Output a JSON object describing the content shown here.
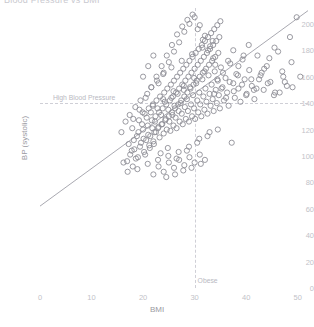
{
  "title": "Blood Pressure vs BMI",
  "axes": {
    "xlabel": "BMI",
    "ylabel": "BP (systolic)",
    "xticks": [
      "0",
      "10",
      "20",
      "30",
      "40",
      "50"
    ],
    "yticks": [
      "0",
      "20",
      "40",
      "60",
      "80",
      "100",
      "120",
      "140",
      "160",
      "180",
      "200"
    ]
  },
  "annotations": {
    "high_bp": "High Blood Pressure",
    "obese": "Obese"
  },
  "colors": {
    "marker": "#8e8e96",
    "trend": "#a9a9b1",
    "refline": "#cfcfd6",
    "tick": "#c2c2c8"
  },
  "chart_data": {
    "type": "scatter",
    "title": "Blood Pressure vs BMI",
    "xlabel": "BMI",
    "ylabel": "BP (systolic)",
    "xlim": [
      0,
      52
    ],
    "ylim": [
      0,
      212
    ],
    "xticks": [
      0,
      10,
      20,
      30,
      40,
      50
    ],
    "yticks": [
      0,
      20,
      40,
      60,
      80,
      100,
      120,
      140,
      160,
      180,
      200
    ],
    "grid": false,
    "legend": "none",
    "marker_style": "open-circle",
    "reference_lines": [
      {
        "orientation": "horizontal",
        "value": 140,
        "label": "High Blood Pressure",
        "style": "dashed"
      },
      {
        "orientation": "vertical",
        "value": 30,
        "label": "Obese",
        "style": "dashed"
      }
    ],
    "trend_line": {
      "x": [
        0,
        52
      ],
      "y": [
        62,
        210
      ],
      "style": "solid"
    },
    "points": [
      [
        17.8,
        104
      ],
      [
        18.2,
        112
      ],
      [
        18.6,
        98
      ],
      [
        19.1,
        118
      ],
      [
        19.4,
        107
      ],
      [
        19.8,
        124
      ],
      [
        20.1,
        113
      ],
      [
        20.4,
        101
      ],
      [
        20.7,
        129
      ],
      [
        21.0,
        116
      ],
      [
        21.2,
        108
      ],
      [
        21.5,
        133
      ],
      [
        21.8,
        121
      ],
      [
        22.0,
        111
      ],
      [
        22.3,
        126
      ],
      [
        22.5,
        118
      ],
      [
        22.8,
        136
      ],
      [
        23.0,
        122
      ],
      [
        23.2,
        114
      ],
      [
        23.5,
        131
      ],
      [
        23.7,
        124
      ],
      [
        24.0,
        117
      ],
      [
        24.2,
        141
      ],
      [
        24.4,
        128
      ],
      [
        24.6,
        120
      ],
      [
        24.9,
        135
      ],
      [
        25.1,
        126
      ],
      [
        25.3,
        119
      ],
      [
        25.5,
        144
      ],
      [
        25.7,
        131
      ],
      [
        25.9,
        123
      ],
      [
        26.1,
        138
      ],
      [
        26.3,
        129
      ],
      [
        26.5,
        121
      ],
      [
        26.7,
        147
      ],
      [
        26.9,
        134
      ],
      [
        27.1,
        126
      ],
      [
        27.3,
        140
      ],
      [
        27.5,
        132
      ],
      [
        27.7,
        124
      ],
      [
        27.9,
        150
      ],
      [
        28.1,
        137
      ],
      [
        28.3,
        128
      ],
      [
        28.5,
        143
      ],
      [
        28.7,
        134
      ],
      [
        28.9,
        126
      ],
      [
        29.1,
        152
      ],
      [
        29.3,
        139
      ],
      [
        29.5,
        130
      ],
      [
        29.7,
        146
      ],
      [
        29.9,
        136
      ],
      [
        30.1,
        128
      ],
      [
        30.3,
        155
      ],
      [
        30.5,
        142
      ],
      [
        30.7,
        133
      ],
      [
        30.9,
        148
      ],
      [
        31.1,
        139
      ],
      [
        31.3,
        130
      ],
      [
        31.5,
        158
      ],
      [
        31.7,
        145
      ],
      [
        31.9,
        135
      ],
      [
        32.1,
        151
      ],
      [
        32.3,
        141
      ],
      [
        32.5,
        132
      ],
      [
        32.7,
        161
      ],
      [
        32.9,
        147
      ],
      [
        33.1,
        138
      ],
      [
        33.3,
        154
      ],
      [
        33.5,
        143
      ],
      [
        33.7,
        134
      ],
      [
        33.9,
        164
      ],
      [
        34.1,
        150
      ],
      [
        34.3,
        140
      ],
      [
        34.5,
        157
      ],
      [
        34.7,
        146
      ],
      [
        34.9,
        136
      ],
      [
        35.1,
        167
      ],
      [
        35.4,
        152
      ],
      [
        35.7,
        142
      ],
      [
        36.0,
        159
      ],
      [
        36.3,
        148
      ],
      [
        36.6,
        138
      ],
      [
        36.9,
        170
      ],
      [
        37.2,
        110
      ],
      [
        37.5,
        155
      ],
      [
        37.8,
        144
      ],
      [
        38.1,
        162
      ],
      [
        38.5,
        151
      ],
      [
        38.9,
        141
      ],
      [
        39.3,
        173
      ],
      [
        39.7,
        158
      ],
      [
        40.1,
        147
      ],
      [
        40.6,
        165
      ],
      [
        41.1,
        153
      ],
      [
        41.6,
        143
      ],
      [
        42.2,
        176
      ],
      [
        42.8,
        161
      ],
      [
        43.4,
        150
      ],
      [
        44.0,
        168
      ],
      [
        44.7,
        156
      ],
      [
        45.4,
        146
      ],
      [
        46.2,
        179
      ],
      [
        47.0,
        164
      ],
      [
        47.9,
        153
      ],
      [
        48.8,
        171
      ],
      [
        49.8,
        205
      ],
      [
        50.5,
        160
      ],
      [
        16.9,
        96
      ],
      [
        17.2,
        109
      ],
      [
        17.5,
        101
      ],
      [
        17.9,
        121
      ],
      [
        18.3,
        105
      ],
      [
        18.8,
        115
      ],
      [
        19.2,
        127
      ],
      [
        19.6,
        110
      ],
      [
        20.0,
        120
      ],
      [
        20.3,
        132
      ],
      [
        20.6,
        112
      ],
      [
        20.9,
        123
      ],
      [
        21.1,
        136
      ],
      [
        21.4,
        115
      ],
      [
        21.7,
        127
      ],
      [
        21.9,
        139
      ],
      [
        22.2,
        118
      ],
      [
        22.4,
        130
      ],
      [
        22.6,
        142
      ],
      [
        22.9,
        121
      ],
      [
        23.1,
        133
      ],
      [
        23.3,
        145
      ],
      [
        23.6,
        124
      ],
      [
        23.8,
        136
      ],
      [
        24.1,
        148
      ],
      [
        24.3,
        127
      ],
      [
        24.5,
        139
      ],
      [
        24.7,
        151
      ],
      [
        25.0,
        130
      ],
      [
        25.2,
        142
      ],
      [
        25.4,
        154
      ],
      [
        25.6,
        133
      ],
      [
        25.8,
        145
      ],
      [
        26.0,
        157
      ],
      [
        26.2,
        136
      ],
      [
        26.4,
        148
      ],
      [
        26.6,
        160
      ],
      [
        26.8,
        139
      ],
      [
        27.0,
        151
      ],
      [
        27.2,
        163
      ],
      [
        27.4,
        142
      ],
      [
        27.6,
        154
      ],
      [
        27.8,
        166
      ],
      [
        28.0,
        145
      ],
      [
        28.2,
        157
      ],
      [
        28.4,
        169
      ],
      [
        28.6,
        148
      ],
      [
        28.8,
        160
      ],
      [
        29.0,
        172
      ],
      [
        29.2,
        151
      ],
      [
        29.4,
        163
      ],
      [
        29.6,
        175
      ],
      [
        29.8,
        154
      ],
      [
        30.0,
        166
      ],
      [
        30.2,
        178
      ],
      [
        30.4,
        157
      ],
      [
        30.6,
        169
      ],
      [
        30.8,
        181
      ],
      [
        31.0,
        160
      ],
      [
        31.2,
        172
      ],
      [
        31.4,
        184
      ],
      [
        31.6,
        163
      ],
      [
        31.8,
        175
      ],
      [
        32.0,
        187
      ],
      [
        32.2,
        166
      ],
      [
        32.4,
        178
      ],
      [
        32.6,
        190
      ],
      [
        32.8,
        169
      ],
      [
        33.0,
        181
      ],
      [
        33.2,
        193
      ],
      [
        33.4,
        172
      ],
      [
        33.6,
        184
      ],
      [
        33.8,
        196
      ],
      [
        34.0,
        175
      ],
      [
        34.2,
        187
      ],
      [
        34.4,
        199
      ],
      [
        34.6,
        178
      ],
      [
        34.8,
        190
      ],
      [
        35.0,
        202
      ],
      [
        15.8,
        118
      ],
      [
        16.2,
        95
      ],
      [
        16.6,
        126
      ],
      [
        17.0,
        88
      ],
      [
        17.4,
        131
      ],
      [
        18.0,
        92
      ],
      [
        18.5,
        137
      ],
      [
        19.0,
        99
      ],
      [
        19.5,
        142
      ],
      [
        20.2,
        103
      ],
      [
        20.8,
        147
      ],
      [
        21.3,
        106
      ],
      [
        21.6,
        152
      ],
      [
        22.1,
        109
      ],
      [
        22.7,
        157
      ],
      [
        23.4,
        102
      ],
      [
        23.9,
        162
      ],
      [
        24.8,
        106
      ],
      [
        25.5,
        167
      ],
      [
        26.5,
        98
      ],
      [
        27.5,
        172
      ],
      [
        28.5,
        104
      ],
      [
        29.5,
        177
      ],
      [
        30.5,
        110
      ],
      [
        31.5,
        182
      ],
      [
        32.5,
        115
      ],
      [
        33.5,
        187
      ],
      [
        34.5,
        120
      ],
      [
        19.3,
        135
      ],
      [
        20.5,
        144
      ],
      [
        21.6,
        152
      ],
      [
        22.6,
        160
      ],
      [
        23.6,
        168
      ],
      [
        24.6,
        176
      ],
      [
        25.6,
        184
      ],
      [
        26.6,
        192
      ],
      [
        27.6,
        198
      ],
      [
        28.6,
        203
      ],
      [
        29.6,
        207
      ],
      [
        30.6,
        196
      ],
      [
        31.6,
        188
      ],
      [
        32.6,
        180
      ],
      [
        33.6,
        174
      ],
      [
        18.1,
        128
      ],
      [
        18.9,
        90
      ],
      [
        19.9,
        133
      ],
      [
        20.9,
        94
      ],
      [
        21.9,
        138
      ],
      [
        22.9,
        97
      ],
      [
        23.9,
        143
      ],
      [
        24.9,
        100
      ],
      [
        25.9,
        149
      ],
      [
        26.9,
        103
      ],
      [
        27.9,
        153
      ],
      [
        28.9,
        107
      ],
      [
        29.9,
        159
      ],
      [
        30.9,
        113
      ],
      [
        31.9,
        164
      ],
      [
        32.9,
        118
      ],
      [
        35.5,
        163
      ],
      [
        36.5,
        172
      ],
      [
        37.5,
        180
      ],
      [
        38.5,
        168
      ],
      [
        39.5,
        176
      ],
      [
        40.5,
        184
      ],
      [
        41.5,
        150
      ],
      [
        42.5,
        158
      ],
      [
        43.5,
        166
      ],
      [
        44.5,
        174
      ],
      [
        45.5,
        182
      ],
      [
        46.5,
        148
      ],
      [
        47.5,
        156
      ],
      [
        48.5,
        190
      ],
      [
        22.0,
        86
      ],
      [
        23.0,
        92
      ],
      [
        24.0,
        88
      ],
      [
        25.0,
        95
      ],
      [
        26.0,
        91
      ],
      [
        27.0,
        97
      ],
      [
        28.0,
        93
      ],
      [
        29.0,
        99
      ],
      [
        30.0,
        95
      ],
      [
        31.0,
        101
      ],
      [
        32.0,
        97
      ],
      [
        24.5,
        84
      ],
      [
        26.2,
        86
      ],
      [
        27.8,
        89
      ],
      [
        29.4,
        91
      ],
      [
        31.2,
        94
      ],
      [
        20.0,
        160
      ],
      [
        21.0,
        168
      ],
      [
        22.0,
        176
      ],
      [
        23.0,
        155
      ],
      [
        24.0,
        163
      ],
      [
        25.0,
        171
      ],
      [
        26.0,
        179
      ],
      [
        27.0,
        186
      ],
      [
        28.0,
        194
      ],
      [
        29.0,
        200
      ],
      [
        30.0,
        205
      ],
      [
        31.0,
        199
      ],
      [
        32.0,
        191
      ],
      [
        33.0,
        183
      ],
      [
        34.0,
        169
      ],
      [
        33.8,
        147
      ],
      [
        34.4,
        158
      ],
      [
        35.2,
        151
      ],
      [
        36.1,
        144
      ],
      [
        36.8,
        156
      ],
      [
        37.6,
        149
      ],
      [
        38.4,
        161
      ],
      [
        39.2,
        154
      ],
      [
        40.0,
        146
      ],
      [
        41.0,
        158
      ],
      [
        42.0,
        151
      ],
      [
        43.0,
        163
      ],
      [
        44.2,
        155
      ],
      [
        45.6,
        148
      ],
      [
        47.2,
        160
      ],
      [
        49.0,
        152
      ]
    ]
  }
}
